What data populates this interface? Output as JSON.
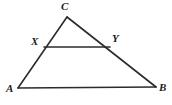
{
  "figure": {
    "kind": "geometry-diagram",
    "shape": "triangle-with-midsegment",
    "background_color": "#ffffff",
    "stroke_color": "#2b2b2b",
    "stroke_width": 1.6,
    "label_color": "#1c1c1c",
    "width": 172,
    "height": 105,
    "points": {
      "A": {
        "label": "A",
        "x": 18,
        "y": 88,
        "label_x": 6,
        "label_y": 83
      },
      "B": {
        "label": "B",
        "x": 156,
        "y": 87,
        "label_x": 159,
        "label_y": 82
      },
      "C": {
        "label": "C",
        "x": 67,
        "y": 17,
        "label_x": 61,
        "label_y": 1
      },
      "X": {
        "label": "X",
        "x": 44,
        "y": 47,
        "label_x": 31,
        "label_y": 36
      },
      "Y": {
        "label": "Y",
        "x": 110,
        "y": 47,
        "label_x": 112,
        "label_y": 33
      }
    },
    "segments": [
      {
        "name": "side-AC",
        "from": "A",
        "to": "C"
      },
      {
        "name": "side-CB",
        "from": "C",
        "to": "B"
      },
      {
        "name": "side-AB",
        "from": "A",
        "to": "B"
      },
      {
        "name": "midsegment-XY",
        "from": "X",
        "to": "Y"
      }
    ],
    "caption_ghost": "· · · · · ·"
  }
}
